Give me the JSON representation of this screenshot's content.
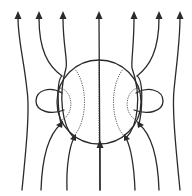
{
  "diagram": {
    "title": "",
    "colors": {
      "line": "#2a2a2a",
      "interior": "#555555",
      "background": "#ffffff"
    },
    "sphere": {
      "cx": 99,
      "cy": 102,
      "r": 42
    },
    "field_lines_count": 7,
    "loops_count": 2,
    "interior_lines_count": 5,
    "arrow_direction": "up"
  }
}
